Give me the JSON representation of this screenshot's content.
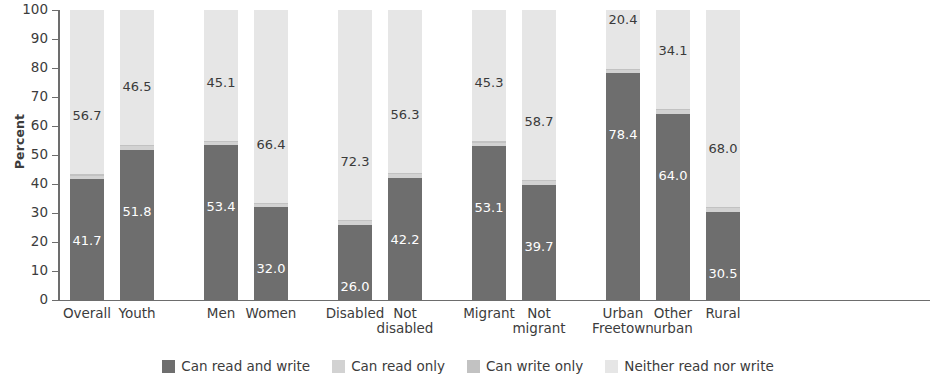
{
  "chart": {
    "type": "bar",
    "ylabel": "Percent",
    "ylim": [
      0,
      100
    ],
    "yticks": [
      100,
      90,
      80,
      70,
      60,
      50,
      40,
      30,
      20,
      10,
      0
    ]
  },
  "legend": {
    "items": [
      {
        "label": "Can read and write",
        "color": "#6e6e6e"
      },
      {
        "label": "Can read only",
        "color": "#d2d2d2"
      },
      {
        "label": "Can write only",
        "color": "#c2c2c2"
      },
      {
        "label": "Neither read nor write",
        "color": "#e6e6e6"
      }
    ]
  },
  "chart_data": {
    "type": "bar",
    "title": "",
    "subtitle": "",
    "xlabel": "",
    "ylabel": "Percent",
    "ylim": [
      0,
      100
    ],
    "grid": false,
    "stacked": true,
    "legend_position": "bottom",
    "yticks": [
      0,
      10,
      20,
      30,
      40,
      50,
      60,
      70,
      80,
      90,
      100
    ],
    "categories": [
      "Overall",
      "Youth",
      "Men",
      "Women",
      "Disabled",
      "Not disabled",
      "Migrant",
      "Not migrant",
      "Urban Freetown",
      "Other urban",
      "Rural"
    ],
    "category_lines": [
      [
        "Overall"
      ],
      [
        "Youth"
      ],
      [
        "Men"
      ],
      [
        "Women"
      ],
      [
        "Disabled"
      ],
      [
        "Not",
        "disabled"
      ],
      [
        "Migrant"
      ],
      [
        "Not",
        "migrant"
      ],
      [
        "Urban",
        "Freetown"
      ],
      [
        "Other",
        "urban"
      ],
      [
        "Rural"
      ]
    ],
    "group_breaks_after": [
      "Youth",
      "Women",
      "Not disabled",
      "Not migrant"
    ],
    "series": [
      {
        "name": "Can read and write",
        "values": [
          41.7,
          51.8,
          53.4,
          32.0,
          26.0,
          42.2,
          53.1,
          39.7,
          78.4,
          64.0,
          30.5
        ]
      },
      {
        "name": "Can read only",
        "values": [
          1.2,
          1.3,
          1.1,
          1.2,
          1.3,
          1.1,
          1.2,
          1.2,
          0.8,
          1.4,
          1.1
        ]
      },
      {
        "name": "Can write only",
        "values": [
          0.4,
          0.4,
          0.4,
          0.4,
          0.4,
          0.4,
          0.4,
          0.4,
          0.4,
          0.5,
          0.4
        ]
      },
      {
        "name": "Neither read nor write",
        "values": [
          56.7,
          46.5,
          45.1,
          66.4,
          72.3,
          56.3,
          45.3,
          58.7,
          20.4,
          34.1,
          68.0
        ]
      }
    ],
    "data_labels": {
      "Can read and write": [
        "41.7",
        "51.8",
        "53.4",
        "32.0",
        "26.0",
        "42.2",
        "53.1",
        "39.7",
        "78.4",
        "64.0",
        "30.5"
      ],
      "Neither read nor write": [
        "56.7",
        "46.5",
        "45.1",
        "66.4",
        "72.3",
        "56.3",
        "45.3",
        "58.7",
        "20.4",
        "34.1",
        "68.0"
      ]
    }
  }
}
